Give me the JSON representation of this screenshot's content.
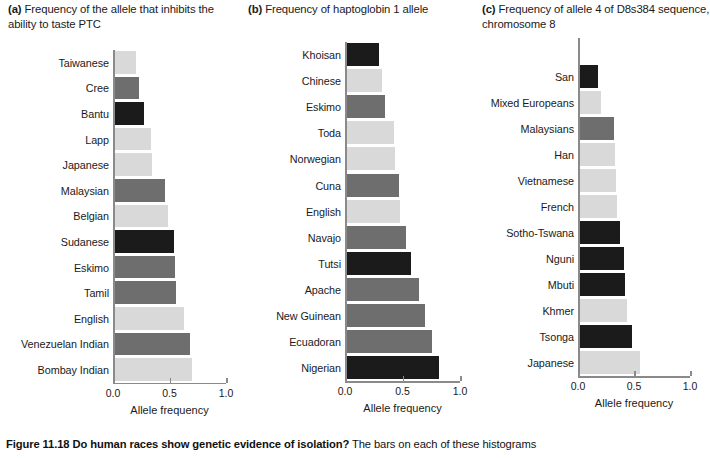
{
  "figure": {
    "caption_number": "Figure 11.18",
    "caption_question": "Do human races show genetic evidence of isolation?",
    "caption_rest": "The bars on each of these histograms"
  },
  "axis": {
    "title": "Allele frequency",
    "ticks": [
      "0.0",
      "0.5",
      "1.0"
    ],
    "min": 0.0,
    "max": 1.0
  },
  "colors": {
    "light": "#d9d9d9",
    "medium": "#6e6e6e",
    "dark": "#1b1b1b",
    "axis": "#8a8a8a"
  },
  "panels": [
    {
      "tag": "(a)",
      "title": "Frequency of the allele that inhibits the ability to taste PTC"
    },
    {
      "tag": "(b)",
      "title": "Frequency of haptoglobin 1 allele"
    },
    {
      "tag": "(c)",
      "title": "Frequency of allele 4 of D8s384 sequence, chromosome 8"
    }
  ],
  "chart_data": [
    {
      "type": "bar",
      "orientation": "horizontal",
      "panel": "(a)",
      "title": "Frequency of the allele that inhibits the ability to taste PTC",
      "xlabel": "Allele frequency",
      "ylabel": "",
      "xlim": [
        0.0,
        1.0
      ],
      "xticks": [
        0.0,
        0.5,
        1.0
      ],
      "grid": false,
      "legend": null,
      "categories": [
        "Taiwanese",
        "Cree",
        "Bantu",
        "Lapp",
        "Japanese",
        "Malaysian",
        "Belgian",
        "Sudanese",
        "Eskimo",
        "Tamil",
        "English",
        "Venezuelan Indian",
        "Bombay Indian"
      ],
      "values": [
        0.19,
        0.21,
        0.26,
        0.32,
        0.33,
        0.44,
        0.47,
        0.52,
        0.53,
        0.54,
        0.61,
        0.66,
        0.68
      ],
      "shades": [
        "light",
        "medium",
        "dark",
        "light",
        "light",
        "medium",
        "light",
        "dark",
        "medium",
        "medium",
        "light",
        "medium",
        "light"
      ]
    },
    {
      "type": "bar",
      "orientation": "horizontal",
      "panel": "(b)",
      "title": "Frequency of haptoglobin 1 allele",
      "xlabel": "Allele frequency",
      "ylabel": "",
      "xlim": [
        0.0,
        1.0
      ],
      "xticks": [
        0.0,
        0.5,
        1.0
      ],
      "grid": false,
      "legend": null,
      "categories": [
        "Khoisan",
        "Chinese",
        "Eskimo",
        "Toda",
        "Norwegian",
        "Cuna",
        "English",
        "Navajo",
        "Tutsi",
        "Apache",
        "New Guinean",
        "Ecuadoran",
        "Nigerian"
      ],
      "values": [
        0.28,
        0.3,
        0.33,
        0.41,
        0.42,
        0.45,
        0.46,
        0.51,
        0.56,
        0.63,
        0.68,
        0.74,
        0.8
      ],
      "shades": [
        "dark",
        "light",
        "medium",
        "light",
        "light",
        "medium",
        "light",
        "medium",
        "dark",
        "medium",
        "medium",
        "medium",
        "dark"
      ]
    },
    {
      "type": "bar",
      "orientation": "horizontal",
      "panel": "(c)",
      "title": "Frequency of allele 4 of D8s384 sequence, chromosome 8",
      "xlabel": "Allele frequency",
      "ylabel": "",
      "xlim": [
        0.0,
        1.0
      ],
      "xticks": [
        0.0,
        0.5,
        1.0
      ],
      "grid": false,
      "legend": null,
      "categories": [
        "San",
        "Mixed Europeans",
        "Malaysians",
        "Han",
        "Vietnamese",
        "French",
        "Sotho-Tswana",
        "Nguni",
        "Mbuti",
        "Khmer",
        "Tsonga",
        "Japanese"
      ],
      "values": [
        0.16,
        0.19,
        0.3,
        0.31,
        0.32,
        0.33,
        0.36,
        0.39,
        0.4,
        0.42,
        0.46,
        0.54
      ],
      "shades": [
        "dark",
        "light",
        "medium",
        "light",
        "light",
        "light",
        "dark",
        "dark",
        "dark",
        "light",
        "dark",
        "light"
      ]
    }
  ]
}
